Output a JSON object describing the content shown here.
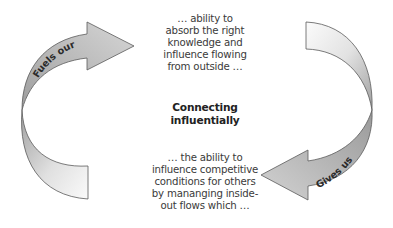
{
  "diagram": {
    "title_lines": [
      "Connecting",
      "influentially"
    ],
    "top_text_lines": [
      "… ability to",
      "absorb the right",
      "knowledge and",
      "influence flowing",
      "from outside …"
    ],
    "bottom_text_lines": [
      "… the ability to",
      "influence competitive",
      "conditions for others",
      "by mananging inside-",
      "out flows which …"
    ],
    "arrows": [
      {
        "label": "Fuels our",
        "direction": "up-right",
        "position": "left"
      },
      {
        "label": "Gives us",
        "direction": "down-left",
        "position": "right"
      }
    ],
    "colors": {
      "arrow_fill_dark": "#a8a8a8",
      "arrow_fill_light": "#f4f4f4",
      "arrow_stroke": "#5a5a5a",
      "text": "#3a3a3a"
    }
  }
}
